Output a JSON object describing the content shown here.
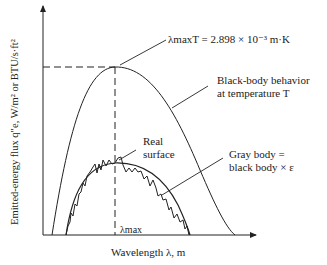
{
  "axes": {
    "ylabel": "Emitted-energy flux q″e, W/m² or BTU/s·ft²",
    "xlabel": "Wavelength λ, m",
    "lambda_max_tick": "λmax"
  },
  "annotations": {
    "wien_law": "λmaxT = 2.898 × 10⁻³ m·K",
    "black_body_line1": "Black-body behavior",
    "black_body_line2": "at temperature T",
    "real_surface_line1": "Real",
    "real_surface_line2": "surface",
    "gray_body_line1": "Gray body =",
    "gray_body_line2": "black body × ε"
  },
  "colors": {
    "ink": "#222222"
  }
}
